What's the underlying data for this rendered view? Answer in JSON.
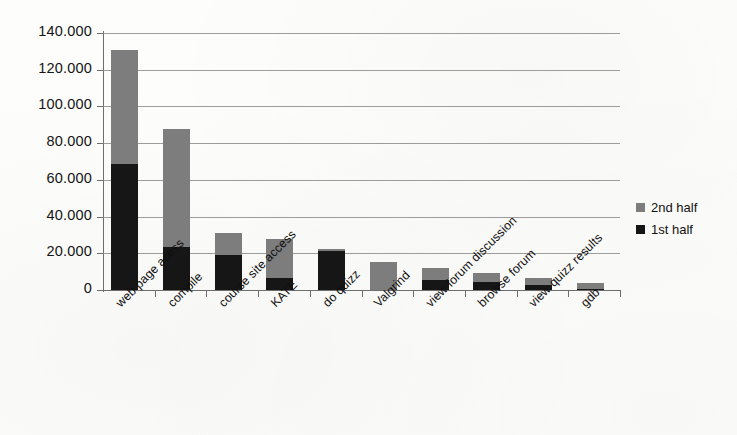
{
  "chart_data": {
    "type": "bar",
    "stacked": true,
    "title": "",
    "xlabel": "",
    "ylabel": "",
    "ylim": [
      0,
      140000
    ],
    "grid": true,
    "legend_position": "right",
    "categories": [
      "web page acess",
      "compile",
      "course site access",
      "KATE",
      "do quizz",
      "Valgrind",
      "view forum discussion",
      "browse forum",
      "view quizz results",
      "gdb"
    ],
    "y_ticks": [
      0,
      20000,
      40000,
      60000,
      80000,
      100000,
      120000,
      140000
    ],
    "y_tick_labels": [
      "0",
      "20.000",
      "40.000",
      "60.000",
      "80.000",
      "100.000",
      "120.000",
      "140.000"
    ],
    "series": [
      {
        "name": "1st half",
        "color": "#161616",
        "values": [
          68500,
          23500,
          19000,
          6500,
          21500,
          0,
          5500,
          4500,
          2500,
          500
        ]
      },
      {
        "name": "2nd half",
        "color": "#7d7d7d",
        "values": [
          62500,
          64000,
          12000,
          21500,
          1000,
          15000,
          6500,
          5000,
          4000,
          3500
        ]
      }
    ],
    "totals": [
      131000,
      87500,
      31000,
      28000,
      22500,
      15000,
      12000,
      9500,
      6500,
      4000
    ]
  },
  "legend": {
    "items": [
      {
        "label": "2nd half",
        "color": "#7d7d7d"
      },
      {
        "label": "1st half",
        "color": "#161616"
      }
    ]
  }
}
